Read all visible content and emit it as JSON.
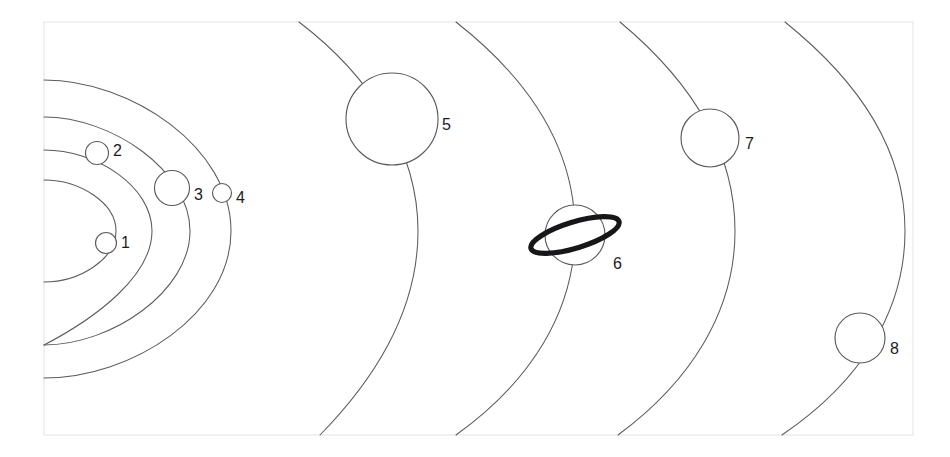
{
  "figure": {
    "kind": "solar-system-orbit-diagram",
    "background_color": "#ffffff",
    "frame_color": "#eceef0",
    "orbit_color": "#5c5c60",
    "planet_fill": "#ffffff",
    "planet_stroke": "#5c5c60",
    "ring_color": "#17171a",
    "label_color": "#1b1b1e",
    "frame": {
      "x": 44,
      "y": 22,
      "width": 869,
      "height": 413
    }
  },
  "orbits": [
    {
      "id": "orbit-1",
      "name": "orbit-1",
      "cx": -44,
      "cy": 231,
      "rx": 160,
      "ry": 51,
      "path": "M 44,180 C 80,180 116,203 116,231 C 116,259 80,282 44,282"
    },
    {
      "id": "orbit-2",
      "name": "orbit-2",
      "cx": -44,
      "cy": 231,
      "rx": 196,
      "ry": 84,
      "path": "M 44,150 C 96,150 152,186 152,231 C 152,276 96,318 44,345"
    },
    {
      "id": "orbit-3",
      "name": "orbit-3",
      "cx": -44,
      "cy": 231,
      "rx": 234,
      "ry": 114,
      "path": "M 44,117 C 112,117 190,171 190,231 C 190,291 112,345 44,345"
    },
    {
      "id": "orbit-4",
      "name": "orbit-4",
      "cx": -44,
      "cy": 231,
      "rx": 275,
      "ry": 149,
      "path": "M 44,80 C 132,80 231,148 231,231 C 231,314 132,378 44,378"
    },
    {
      "id": "orbit-5",
      "name": "orbit-5",
      "cx": -130,
      "cy": 231,
      "rx": 548,
      "ry": 320,
      "path": "M 299,22 C 370,76 418,150 418,231 C 418,312 372,382 320,435"
    },
    {
      "id": "orbit-6",
      "name": "orbit-6",
      "cx": -130,
      "cy": 231,
      "rx": 705,
      "ry": 400,
      "path": "M 456,22 C 530,80 575,150 575,231 C 575,312 530,382 456,435"
    },
    {
      "id": "orbit-7",
      "name": "orbit-7",
      "cx": -130,
      "cy": 231,
      "rx": 865,
      "ry": 470,
      "path": "M 620,22 C 692,82 735,152 735,231 C 735,312 690,382 618,435"
    },
    {
      "id": "orbit-8",
      "name": "orbit-8",
      "cx": -130,
      "cy": 231,
      "rx": 1035,
      "ry": 540,
      "path": "M 785,22 C 862,84 905,152 905,231 C 905,312 860,382 782,435"
    }
  ],
  "planets": [
    {
      "id": "planet-1",
      "label": "1",
      "cx": 106,
      "cy": 243,
      "r": 10.5,
      "label_x": 121,
      "label_y": 244,
      "has_ring": false
    },
    {
      "id": "planet-2",
      "label": "2",
      "cx": 97,
      "cy": 153,
      "r": 11.5,
      "label_x": 113,
      "label_y": 152,
      "has_ring": false
    },
    {
      "id": "planet-3",
      "label": "3",
      "cx": 172,
      "cy": 188,
      "r": 17.5,
      "label_x": 194,
      "label_y": 196,
      "has_ring": false
    },
    {
      "id": "planet-4",
      "label": "4",
      "cx": 222,
      "cy": 193,
      "r": 9.5,
      "label_x": 236,
      "label_y": 199,
      "has_ring": false
    },
    {
      "id": "planet-5",
      "label": "5",
      "cx": 392,
      "cy": 119,
      "r": 46,
      "label_x": 442,
      "label_y": 126,
      "has_ring": false
    },
    {
      "id": "planet-6",
      "label": "6",
      "cx": 575,
      "cy": 235,
      "r": 30,
      "label_x": 613,
      "label_y": 265,
      "has_ring": true,
      "ring": {
        "rx": 46,
        "ry": 13,
        "rotation": -17
      }
    },
    {
      "id": "planet-7",
      "label": "7",
      "cx": 710,
      "cy": 138,
      "r": 29,
      "label_x": 745,
      "label_y": 145,
      "has_ring": false
    },
    {
      "id": "planet-8",
      "label": "8",
      "cx": 860,
      "cy": 338,
      "r": 25,
      "label_x": 890,
      "label_y": 350,
      "has_ring": false
    }
  ],
  "legend": {
    "labels": [
      "1",
      "2",
      "3",
      "4",
      "5",
      "6",
      "7",
      "8"
    ]
  }
}
